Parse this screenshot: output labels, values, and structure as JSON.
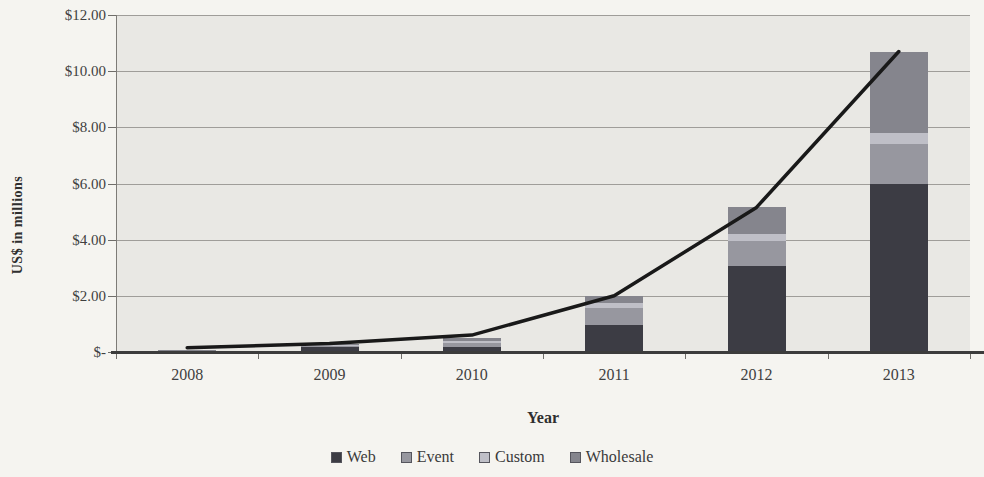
{
  "chart_data": {
    "type": "bar",
    "variant": "stacked-column-with-line-overlay",
    "title": "",
    "xlabel": "Year",
    "ylabel": "US$ in millions",
    "categories": [
      "2008",
      "2009",
      "2010",
      "2011",
      "2012",
      "2013"
    ],
    "series": [
      {
        "name": "Web",
        "color": "#3c3c44",
        "values": [
          0.05,
          0.18,
          0.18,
          0.95,
          3.05,
          6.0
        ]
      },
      {
        "name": "Event",
        "color": "#97979f",
        "values": [
          0.01,
          0.05,
          0.15,
          0.6,
          0.9,
          1.4
        ]
      },
      {
        "name": "Custom",
        "color": "#bfbfc7",
        "values": [
          0.01,
          0.02,
          0.05,
          0.18,
          0.25,
          0.4
        ]
      },
      {
        "name": "Wholesale",
        "color": "#85858d",
        "values": [
          0.01,
          0.05,
          0.12,
          0.27,
          0.95,
          2.9
        ]
      }
    ],
    "totals": [
      0.08,
      0.3,
      0.5,
      2.0,
      5.15,
      10.7
    ],
    "line_series": {
      "name": "Total revenue",
      "color": "#191919",
      "values": [
        0.15,
        0.3,
        0.6,
        2.0,
        5.15,
        10.7
      ]
    },
    "ylim": [
      0,
      12
    ],
    "ytick_step": 2,
    "ytick_labels_top_to_bottom": [
      "$12.00",
      "$10.00",
      "$8.00",
      "$6.00",
      "$4.00",
      "$2.00",
      "$-"
    ],
    "grid": true,
    "legend_position": "bottom",
    "legend_labels": [
      "Web",
      "Event",
      "Custom",
      "Wholesale"
    ]
  },
  "style": {
    "page_bg": "#f5f4f0",
    "plot_bg": "#e9e8e4",
    "grid_color": "#9f9d99",
    "axis_color": "#7d7b77",
    "baseline_color": "#3c3c3c",
    "text_color": "#3a3a3a"
  }
}
